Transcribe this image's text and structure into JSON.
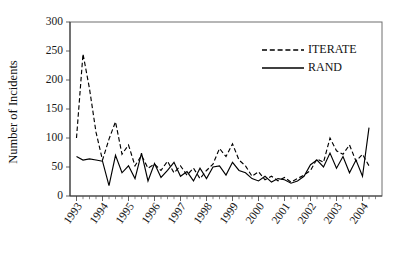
{
  "chart_data": {
    "type": "line",
    "title": "",
    "xlabel": "",
    "ylabel": "Number of Incidents",
    "ylim": [
      0,
      300
    ],
    "yticks": [
      0,
      50,
      100,
      150,
      200,
      250,
      300
    ],
    "ytick_labels": [
      "0",
      "50",
      "100",
      "150",
      "200",
      "250",
      "300"
    ],
    "xlim": [
      1992.75,
      2004.75
    ],
    "categories": [
      "1993",
      "1994",
      "1995",
      "1996",
      "1997",
      "1998",
      "1999",
      "2000",
      "2001",
      "2002",
      "2003",
      "2004"
    ],
    "xtick_labels": [
      "1993",
      "1994",
      "1995",
      "1996",
      "1997",
      "1998",
      "1999",
      "2000",
      "2001",
      "2002",
      "2003",
      "2004"
    ],
    "x_tick_interval": "quarterly",
    "grid": false,
    "legend_position": "top-right",
    "series": [
      {
        "name": "ITERATE",
        "style": "dashed",
        "color": "#000000",
        "x": [
          1993.0,
          1993.25,
          1993.5,
          1993.75,
          1994.0,
          1994.25,
          1994.5,
          1994.75,
          1995.0,
          1995.25,
          1995.5,
          1995.75,
          1996.0,
          1996.25,
          1996.5,
          1996.75,
          1997.0,
          1997.25,
          1997.5,
          1997.75,
          1998.0,
          1998.25,
          1998.5,
          1998.75,
          1999.0,
          1999.25,
          1999.5,
          1999.75,
          2000.0,
          2000.25,
          2000.5,
          2000.75,
          2001.0,
          2001.25,
          2001.5,
          2001.75,
          2002.0,
          2002.25,
          2002.5,
          2002.75,
          2003.0,
          2003.25,
          2003.5,
          2003.75,
          2004.0,
          2004.25
        ],
        "values": [
          100,
          245,
          185,
          110,
          62,
          98,
          128,
          72,
          88,
          52,
          70,
          48,
          55,
          44,
          60,
          40,
          52,
          36,
          48,
          30,
          44,
          55,
          82,
          68,
          90,
          62,
          52,
          34,
          42,
          28,
          34,
          26,
          32,
          24,
          30,
          36,
          44,
          64,
          58,
          100,
          78,
          72,
          88,
          60,
          72,
          52
        ]
      },
      {
        "name": "RAND",
        "style": "solid",
        "color": "#000000",
        "x": [
          1993.0,
          1993.25,
          1993.5,
          1993.75,
          1994.0,
          1994.25,
          1994.5,
          1994.75,
          1995.0,
          1995.25,
          1995.5,
          1995.75,
          1996.0,
          1996.25,
          1996.5,
          1996.75,
          1997.0,
          1997.25,
          1997.5,
          1997.75,
          1998.0,
          1998.25,
          1998.5,
          1998.75,
          1999.0,
          1999.25,
          1999.5,
          1999.75,
          2000.0,
          2000.25,
          2000.5,
          2000.75,
          2001.0,
          2001.25,
          2001.5,
          2001.75,
          2002.0,
          2002.25,
          2002.5,
          2002.75,
          2003.0,
          2003.25,
          2003.5,
          2003.75,
          2004.0,
          2004.25
        ],
        "values": [
          68,
          62,
          64,
          62,
          60,
          18,
          70,
          40,
          52,
          30,
          74,
          26,
          56,
          32,
          44,
          58,
          34,
          42,
          26,
          48,
          30,
          50,
          52,
          36,
          58,
          44,
          40,
          30,
          26,
          34,
          24,
          30,
          28,
          22,
          26,
          34,
          54,
          62,
          50,
          74,
          48,
          68,
          40,
          62,
          34,
          118
        ]
      }
    ],
    "legend": [
      {
        "label": "ITERATE",
        "style": "dashed"
      },
      {
        "label": "RAND",
        "style": "solid"
      }
    ]
  }
}
